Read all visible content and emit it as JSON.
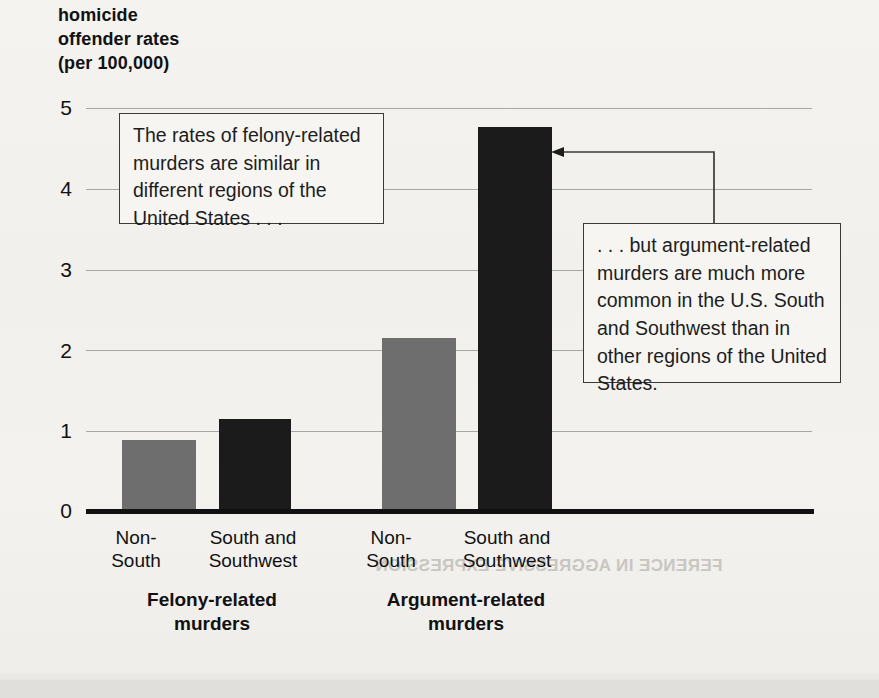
{
  "chart_data": {
    "type": "bar",
    "title": "homicide\noffender rates\n(per 100,000)",
    "xlabel": "",
    "ylabel": "homicide offender rates (per 100,000)",
    "ylim": [
      0,
      5
    ],
    "yticks": [
      "0",
      "1",
      "2",
      "3",
      "4",
      "5"
    ],
    "grid": true,
    "legend": "none",
    "groups": [
      {
        "name": "Felony-related\nmurders",
        "categories": [
          "Non-\nSouth",
          "South and\nSouthwest"
        ],
        "values": [
          0.89,
          1.15
        ],
        "colors": [
          "#6e6e6e",
          "#1b1b1b"
        ]
      },
      {
        "name": "Argument-related\nmurders",
        "categories": [
          "Non-\nSouth",
          "South and\nSouthwest"
        ],
        "values": [
          2.15,
          4.76
        ],
        "colors": [
          "#6e6e6e",
          "#1b1b1b"
        ]
      }
    ],
    "categories": [
      "Felony-related / Non-South",
      "Felony-related / South and Southwest",
      "Argument-related / Non-South",
      "Argument-related / South and Southwest"
    ],
    "values": [
      0.89,
      1.15,
      2.15,
      4.76
    ],
    "annotations": [
      {
        "id": "callout-felony",
        "text": "The rates of felony-related murders are similar in different regions of the United States . . ."
      },
      {
        "id": "callout-argument",
        "text": ". . . but argument-related murders are much more common in the U.S. South and Southwest than in other regions of the United States.",
        "points_to": "Argument-related / South and Southwest"
      }
    ]
  },
  "colors": {
    "bar_gray": "#6e6e6e",
    "bar_dark": "#1b1b1b",
    "gridline": "#a7a7a7",
    "axis": "#111111",
    "page_background": "#f2f1ee",
    "callout_border": "#3a3a3a"
  },
  "ghost_text": {
    "line1": "FERENCE IN AGGRESSIVE EXPRESSION"
  }
}
